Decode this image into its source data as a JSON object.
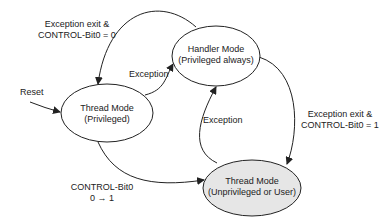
{
  "diagram": {
    "type": "state-diagram",
    "nodes": [
      {
        "id": "thread_priv",
        "line1": "Thread Mode",
        "line2": "(Privileged)",
        "fill": "#ffffff"
      },
      {
        "id": "handler",
        "line1": "Handler Mode",
        "line2": "(Privileged always)",
        "fill": "#ffffff"
      },
      {
        "id": "thread_unpriv",
        "line1": "Thread Mode",
        "line2": "(Unprivileged or User)",
        "fill": "#e6e6e6"
      }
    ],
    "edges": [
      {
        "from": "reset",
        "to": "thread_priv",
        "label": "Reset"
      },
      {
        "from": "thread_priv",
        "to": "handler",
        "label": "Exception"
      },
      {
        "from": "handler",
        "to": "thread_priv",
        "label_line1": "Exception exit &",
        "label_line2": "CONTROL-Bit0 = 0"
      },
      {
        "from": "handler",
        "to": "thread_unpriv",
        "label_line1": "Exception exit &",
        "label_line2": "CONTROL-Bit0 = 1"
      },
      {
        "from": "thread_unpriv",
        "to": "handler",
        "label": "Exception"
      },
      {
        "from": "thread_priv",
        "to": "thread_unpriv",
        "label_line1": "CONTROL-Bit0",
        "label_line2": "0 → 1"
      }
    ]
  }
}
